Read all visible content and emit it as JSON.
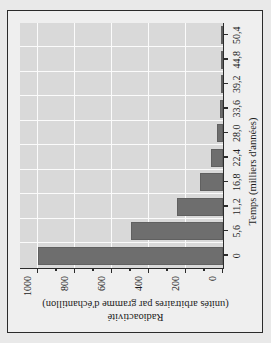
{
  "chart_data": {
    "type": "bar",
    "title": "",
    "xlabel": "Temps (milliers d'années)",
    "ylabel_line1": "Radioactivité",
    "ylabel_line2": "(unités arbitraires par gramme d'échantillon)",
    "categories": [
      "0",
      "5,6",
      "11,2",
      "16,8",
      "22,4",
      "28,0",
      "33,6",
      "39,2",
      "44,8",
      "50,4"
    ],
    "values": [
      1000,
      500,
      250,
      125,
      63,
      31,
      16,
      8,
      4,
      2
    ],
    "xlim": [
      0,
      50.4
    ],
    "ylim": [
      0,
      1100
    ],
    "ytick_values": [
      0,
      200,
      400,
      600,
      800,
      1000
    ],
    "ytick_labels": [
      "0",
      "200",
      "400",
      "600",
      "800",
      "1000"
    ],
    "yminor_values": [
      100,
      300,
      500,
      700,
      900
    ],
    "grid": true,
    "legend": "none",
    "bar_color": "#6e6e6e",
    "plot_bg": "#d9d9d9",
    "grid_color": "#fbfbfb",
    "figure_bg": "#efefef",
    "axis_color": "#2b2b2b",
    "rotation_degrees": -90
  },
  "figure": {
    "xlabel": "Temps (milliers d'années)",
    "ylabel_line1": "Radioactivité",
    "ylabel_line2": "(unités arbitraires par gramme d'échantillon)"
  }
}
